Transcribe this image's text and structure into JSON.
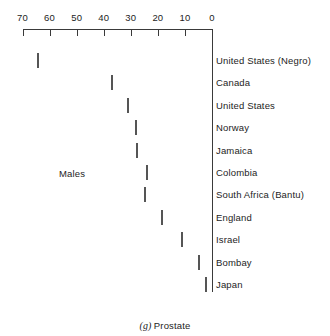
{
  "chart_data": {
    "type": "bar",
    "orientation": "horizontal",
    "title": "",
    "caption_tag": "(g)",
    "caption_text": "Prostate",
    "group_label": "Males",
    "xlabel": "",
    "ylabel": "",
    "xlim": [
      0,
      70
    ],
    "x_axis_reversed": true,
    "x_axis_position": "top",
    "grid": false,
    "legend": false,
    "tick_labels": [
      "70",
      "60",
      "50",
      "40",
      "30",
      "20",
      "10",
      "0"
    ],
    "tick_values": [
      70,
      60,
      50,
      40,
      30,
      20,
      10,
      0
    ],
    "categories": [
      "United States (Negro)",
      "Canada",
      "United States",
      "Norway",
      "Jamaica",
      "Colombia",
      "South Africa (Bantu)",
      "England",
      "Israel",
      "Bombay",
      "Japan"
    ],
    "values": [
      64.8,
      37.3,
      31.4,
      28.4,
      28.1,
      24.4,
      25.1,
      18.8,
      11.5,
      5.2,
      2.6
    ],
    "bar_fill_color": "#e2e2e2",
    "bar_pattern_color": "#b9b9b9",
    "bar_border_color": "#555555",
    "axis_color": "#3a3a3a",
    "text_color": "#1d1d1d"
  }
}
